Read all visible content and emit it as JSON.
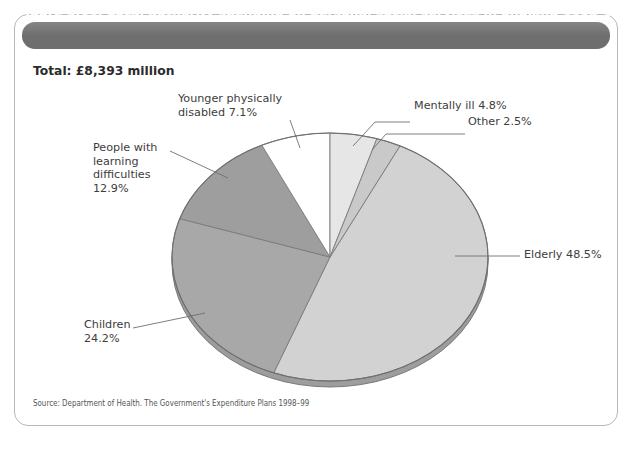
{
  "figure": {
    "title": "Figure 5.11: Local authority spending on personal social services in England 1995–96",
    "total_label": "Total: £8,393 million",
    "source": "Source: Department of Health. The Government's Expenditure Plans 1998–99"
  },
  "labels": {
    "younger": "Younger physically\ndisabled 7.1%",
    "learning": "People with\nlearning\ndifficulties\n12.9%",
    "children": "Children\n24.2%",
    "mentally": "Mentally ill 4.8%",
    "other": "Other 2.5%",
    "elderly": "Elderly 48.5%"
  },
  "colors": {
    "title_bar": "#6e6e6e",
    "frame_border": "#b9b9b9",
    "slice_elderly": "#d2d2d2",
    "slice_children": "#a8a8a8",
    "slice_learning": "#9e9e9e",
    "slice_younger": "#ffffff",
    "slice_mentally": "#e6e6e6",
    "slice_other": "#c9c9c9",
    "slice_outline": "#7a7a7a",
    "leader_line": "#6f6f6f"
  },
  "chart_data": {
    "type": "pie",
    "title": "Figure 5.11: Local authority spending on personal social services in England 1995–96",
    "subtitle": "Total: £8,393 million",
    "categories": [
      "Elderly",
      "Children",
      "People with learning difficulties",
      "Younger physically disabled",
      "Mentally ill",
      "Other"
    ],
    "values": [
      48.5,
      24.2,
      12.9,
      7.1,
      4.8,
      2.5
    ],
    "units": "percent",
    "total": "£8,393 million",
    "legend": "none",
    "labels_position": "callouts with leader lines",
    "slice_colors": [
      "#d2d2d2",
      "#a8a8a8",
      "#9e9e9e",
      "#ffffff",
      "#e6e6e6",
      "#c9c9c9"
    ],
    "start_angle_deg": 0,
    "direction": "clockwise",
    "three_d": true,
    "xlabel": "",
    "ylabel": "",
    "grid": false,
    "annotations": [
      "Younger physically disabled 7.1%",
      "People with learning difficulties 12.9%",
      "Children 24.2%",
      "Mentally ill 4.8%",
      "Other 2.5%",
      "Elderly 48.5%"
    ],
    "source": "Source: Department of Health. The Government's Expenditure Plans 1998–99"
  }
}
